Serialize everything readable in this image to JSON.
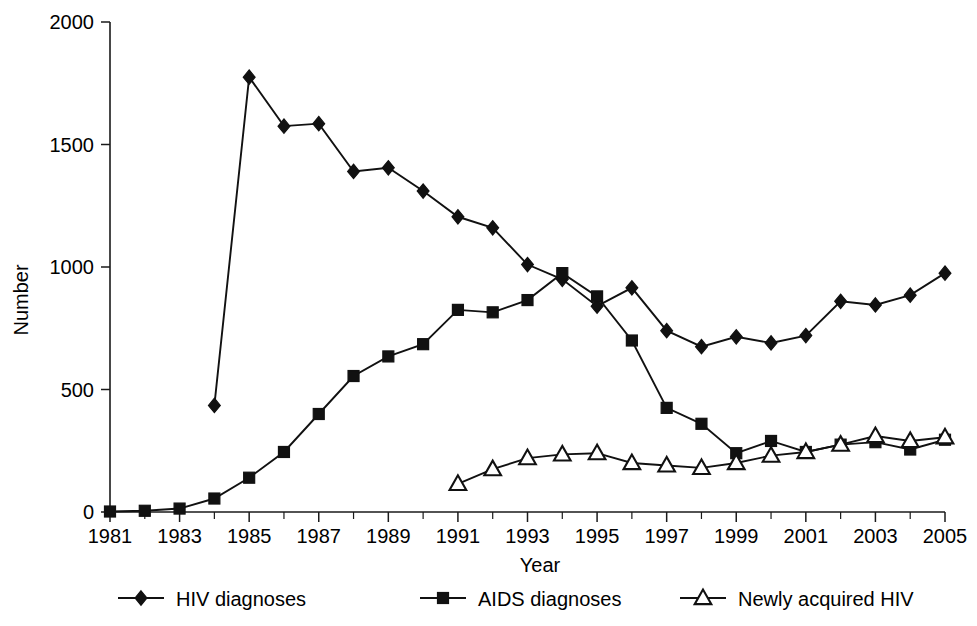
{
  "chart_data": {
    "type": "line",
    "title": "",
    "subtitle": "",
    "xlabel": "Year",
    "ylabel": "Number",
    "xlim": [
      1981,
      2005
    ],
    "ylim": [
      0,
      2000
    ],
    "grid": false,
    "legend_position": "bottom",
    "x": [
      1981,
      1982,
      1983,
      1984,
      1985,
      1986,
      1987,
      1988,
      1989,
      1990,
      1991,
      1992,
      1993,
      1994,
      1995,
      1996,
      1997,
      1998,
      1999,
      2000,
      2001,
      2002,
      2003,
      2004,
      2005
    ],
    "y_ticks": [
      0,
      500,
      1000,
      1500,
      2000
    ],
    "y_tick_labels": [
      "0",
      "500",
      "1000",
      "1500",
      "2000"
    ],
    "x_tick_labels": [
      "1981",
      "1983",
      "1985",
      "1987",
      "1989",
      "1991",
      "1993",
      "1995",
      "1997",
      "1999",
      "2001",
      "2003",
      "2005"
    ],
    "x_tick_values": [
      1981,
      1983,
      1985,
      1987,
      1989,
      1991,
      1993,
      1995,
      1997,
      1999,
      2001,
      2003,
      2005
    ],
    "series": [
      {
        "name": "HIV diagnoses",
        "marker": "diamond",
        "marker_style": "filled",
        "color": "#111111",
        "x": [
          1984,
          1985,
          1986,
          1987,
          1988,
          1989,
          1990,
          1991,
          1992,
          1993,
          1994,
          1995,
          1996,
          1997,
          1998,
          1999,
          2000,
          2001,
          2002,
          2003,
          2004,
          2005
        ],
        "values": [
          435,
          1775,
          1575,
          1585,
          1390,
          1405,
          1310,
          1205,
          1160,
          1010,
          950,
          840,
          915,
          740,
          675,
          715,
          690,
          720,
          860,
          845,
          885,
          975
        ]
      },
      {
        "name": "AIDS diagnoses",
        "marker": "square",
        "marker_style": "filled",
        "color": "#111111",
        "x": [
          1981,
          1982,
          1983,
          1984,
          1985,
          1986,
          1987,
          1988,
          1989,
          1990,
          1991,
          1992,
          1993,
          1994,
          1995,
          1996,
          1997,
          1998,
          1999,
          2000,
          2001,
          2002,
          2003,
          2004,
          2005
        ],
        "values": [
          2,
          5,
          14,
          55,
          140,
          245,
          400,
          555,
          635,
          685,
          825,
          815,
          865,
          975,
          880,
          700,
          425,
          360,
          240,
          290,
          245,
          275,
          285,
          255,
          295
        ]
      },
      {
        "name": "Newly acquired HIV",
        "marker": "triangle",
        "marker_style": "open",
        "color": "#111111",
        "x": [
          1991,
          1992,
          1993,
          1994,
          1995,
          1996,
          1997,
          1998,
          1999,
          2000,
          2001,
          2002,
          2003,
          2004,
          2005
        ],
        "values": [
          115,
          175,
          220,
          235,
          240,
          200,
          190,
          180,
          200,
          230,
          245,
          275,
          310,
          290,
          305
        ]
      }
    ]
  },
  "axes": {
    "y_label": "Number",
    "x_label": "Year"
  },
  "legend": {
    "items": [
      {
        "label": "HIV diagnoses",
        "marker": "diamond"
      },
      {
        "label": "AIDS diagnoses",
        "marker": "square"
      },
      {
        "label": "Newly acquired HIV",
        "marker": "triangle"
      }
    ]
  },
  "footnote": {
    "text": ""
  }
}
